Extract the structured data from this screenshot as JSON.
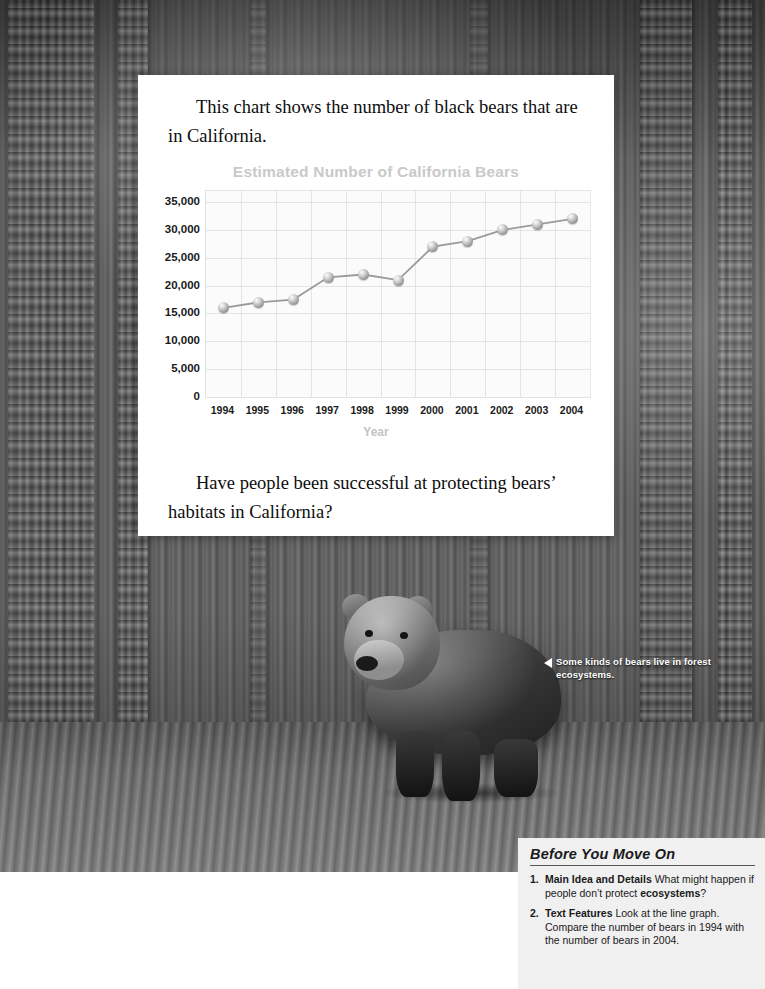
{
  "photo": {
    "caption": "Some kinds of bears live in forest ecosystems.",
    "caption_arrow_icon": "left-triangle-icon",
    "subject": "bear-photo"
  },
  "card": {
    "intro_text": "This chart shows the number of black bears that are in California.",
    "closing_text": "Have people been successful at protecting bears’ habitats in California?"
  },
  "chart_data": {
    "type": "line",
    "title": "Estimated Number of California Bears",
    "xlabel": "Year",
    "ylabel": "",
    "categories": [
      "1994",
      "1995",
      "1996",
      "1997",
      "1998",
      "1999",
      "2000",
      "2001",
      "2002",
      "2003",
      "2004"
    ],
    "values": [
      16000,
      17000,
      17500,
      21500,
      22000,
      21000,
      27000,
      28000,
      30000,
      31000,
      32000
    ],
    "ylim": [
      0,
      37000
    ],
    "y_ticks": [
      "0",
      "5,000",
      "10,000",
      "15,000",
      "20,000",
      "25,000",
      "30,000",
      "35,000"
    ],
    "y_tick_values": [
      0,
      5000,
      10000,
      15000,
      20000,
      25000,
      30000,
      35000
    ],
    "grid": true,
    "legend": "none",
    "marker": "sphere",
    "colors": {
      "line": "#9a9a9a",
      "marker": "#b4b4b4",
      "grid": "#e4e4e4",
      "title": "#c9c9c9",
      "axis_label": "#1a1a1a"
    }
  },
  "before_you_move_on": {
    "title": "Before You Move On",
    "items": [
      {
        "number": "1.",
        "lead": "Main Idea and Details",
        "body": " What might happen if people don’t protect ",
        "bold_tail": "ecosystems",
        "tail": "?"
      },
      {
        "number": "2.",
        "lead": "Text Features",
        "body": " Look at the line graph. Compare the number of bears in 1994 with the number of bears in 2004.",
        "bold_tail": "",
        "tail": ""
      }
    ]
  }
}
